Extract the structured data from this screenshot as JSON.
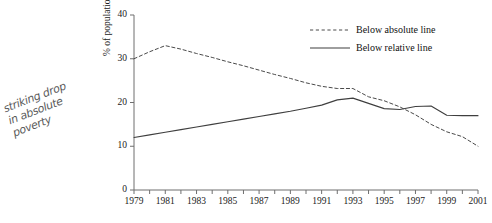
{
  "annotation": {
    "handwritten_note": "striking drop\nin absolute\npoverty"
  },
  "chart_data": {
    "type": "line",
    "title": "",
    "subtitle": "",
    "xlabel": "",
    "ylabel": "% of population",
    "xlim": [
      1979,
      2001
    ],
    "ylim": [
      0,
      40
    ],
    "yticks": [
      0,
      10,
      20,
      30,
      40
    ],
    "xticks": [
      1979,
      1981,
      1983,
      1985,
      1987,
      1989,
      1991,
      1993,
      1995,
      1997,
      1999,
      2001
    ],
    "x": [
      1979,
      1980,
      1981,
      1982,
      1983,
      1984,
      1985,
      1986,
      1987,
      1988,
      1989,
      1990,
      1991,
      1992,
      1993,
      1994,
      1995,
      1996,
      1997,
      1998,
      1999,
      2000,
      2001
    ],
    "grid": false,
    "legend_position": "top-right",
    "series": [
      {
        "name": "Below absolute line",
        "style": "dashed",
        "color": "#4a4a4a",
        "values": [
          30.0,
          31.6,
          33.0,
          32.2,
          31.2,
          30.3,
          29.3,
          28.4,
          27.4,
          26.4,
          25.5,
          24.5,
          23.7,
          23.2,
          23.2,
          21.3,
          20.4,
          19.0,
          17.2,
          15.0,
          13.3,
          12.2,
          10.0
        ]
      },
      {
        "name": "Below relative line",
        "style": "solid",
        "color": "#3f3f3f",
        "values": [
          12.0,
          12.6,
          13.2,
          13.8,
          14.4,
          15.0,
          15.6,
          16.2,
          16.8,
          17.4,
          18.0,
          18.7,
          19.4,
          20.6,
          21.0,
          19.8,
          18.6,
          18.4,
          19.1,
          19.2,
          17.1,
          17.0,
          17.0
        ]
      }
    ],
    "axis_color": "#6e6e6e"
  }
}
